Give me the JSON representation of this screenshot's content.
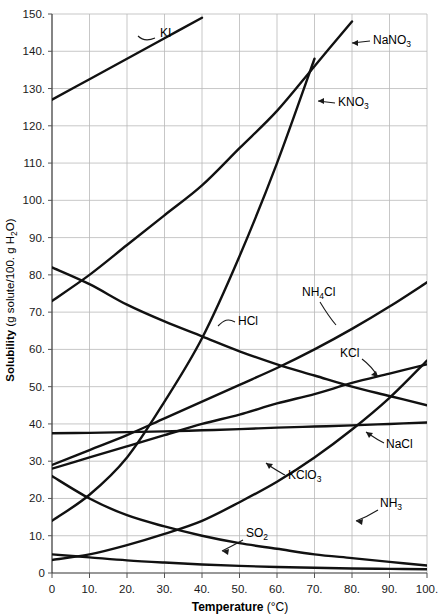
{
  "chart_data": {
    "type": "line",
    "title": "",
    "xlabel": "Temperature (°C)",
    "ylabel": "Solubility (g solute/100. g H2O)",
    "ylabel_parts": {
      "main": "Solubility ",
      "unit_open": "(g solute/100. g H",
      "unit_sub": "2",
      "unit_close": "O)"
    },
    "xlabel_parts": {
      "main": "Temperature ",
      "unit": "(°C)"
    },
    "xlim": [
      0,
      100
    ],
    "ylim": [
      0,
      150
    ],
    "grid": true,
    "legend": "inline-annotations",
    "xticks": [
      "0",
      "10.",
      "20.",
      "30.",
      "40.",
      "50.",
      "60.",
      "70.",
      "80.",
      "90.",
      "100."
    ],
    "xtick_values": [
      0,
      10,
      20,
      30,
      40,
      50,
      60,
      70,
      80,
      90,
      100
    ],
    "yticks": [
      "0",
      "10.",
      "20.",
      "30.",
      "40.",
      "50.",
      "60.",
      "70.",
      "80.",
      "90.",
      "100.",
      "110.",
      "120.",
      "130.",
      "140.",
      "150."
    ],
    "ytick_values": [
      0,
      10,
      20,
      30,
      40,
      50,
      60,
      70,
      80,
      90,
      100,
      110,
      120,
      130,
      140,
      150
    ],
    "x": [
      0,
      10,
      20,
      30,
      40,
      50,
      60,
      70,
      80,
      90,
      100
    ],
    "series": [
      {
        "name": "KI",
        "label_text": "KI",
        "label_base": "KI",
        "label_sub": "",
        "label_x": 160,
        "label_y": 37,
        "leader": "M155,38 C148,41 143,41 138,36",
        "values": [
          127.0,
          132.5,
          138.0,
          143.5,
          149.0,
          null,
          null,
          null,
          null,
          null,
          null
        ]
      },
      {
        "name": "NaNO3",
        "label_text": "NaNO3",
        "label_base": "NaNO",
        "label_sub": "3",
        "label_x": 373,
        "label_y": 44,
        "leader": "M370,41 L352,43",
        "leader_arrow": "M352,43 L358,40 L358,46 Z",
        "values": [
          73.0,
          80.0,
          88.0,
          96.0,
          104.0,
          114.0,
          124.0,
          136.0,
          148.0,
          null,
          null
        ]
      },
      {
        "name": "KNO3",
        "label_text": "KNO3",
        "label_base": "KNO",
        "label_sub": "3",
        "label_x": 338,
        "label_y": 106,
        "leader": "M335,103 L318,101",
        "leader_arrow": "M318,101 L324,98 L324,104 Z",
        "values": [
          14.0,
          21.0,
          31.0,
          46.0,
          63.0,
          85.0,
          110.0,
          138.0,
          null,
          null,
          null
        ]
      },
      {
        "name": "NH4Cl",
        "label_text": "NH4Cl",
        "label_base_a": "NH",
        "label_sub": "4",
        "label_base_b": "Cl",
        "label_x": 302,
        "label_y": 296,
        "leader": "M320,302 C326,312 330,318 336,325",
        "values": [
          29.0,
          33.0,
          37.0,
          41.5,
          46.0,
          50.5,
          55.0,
          60.0,
          65.5,
          71.5,
          78.0
        ]
      },
      {
        "name": "HCl",
        "label_text": "HCl",
        "label_base": "HCl",
        "label_sub": "",
        "label_x": 238,
        "label_y": 325,
        "leader": "M235,322 C228,318 224,320 218,326",
        "values": [
          82.0,
          77.5,
          72.0,
          67.5,
          63.5,
          59.5,
          56.0,
          53.0,
          50.0,
          47.5,
          45.0
        ]
      },
      {
        "name": "KCl",
        "label_text": "KCl",
        "label_base": "KCl",
        "label_sub": "",
        "label_x": 340,
        "label_y": 357,
        "leader": "M362,359 C370,365 374,370 378,377",
        "leader_arrow": "M378,377 L371,375 L376,371 Z",
        "values": [
          28.0,
          31.0,
          34.0,
          37.0,
          40.0,
          42.5,
          45.5,
          48.0,
          51.0,
          53.5,
          56.0
        ]
      },
      {
        "name": "NaCl",
        "label_text": "NaCl",
        "label_base": "NaCl",
        "label_sub": "",
        "label_x": 386,
        "label_y": 448,
        "leader": "M384,443 C376,439 372,436 366,432",
        "leader_arrow": "M366,432 L373,433 L369,438 Z",
        "values": [
          37.5,
          37.6,
          37.8,
          38.0,
          38.3,
          38.6,
          39.0,
          39.3,
          39.6,
          40.0,
          40.4
        ]
      },
      {
        "name": "KClO3",
        "label_text": "KClO3",
        "label_base": "KClO",
        "label_sub": "3",
        "label_x": 288,
        "label_y": 479,
        "leader": "M285,475 C276,470 272,468 266,463",
        "leader_arrow": "M266,463 L273,464 L269,469 Z",
        "values": [
          3.5,
          5.0,
          7.5,
          10.5,
          14.0,
          19.0,
          24.5,
          31.0,
          38.5,
          47.0,
          57.0
        ]
      },
      {
        "name": "NH3",
        "label_text": "NH3",
        "label_base": "NH",
        "label_sub": "3",
        "label_x": 380,
        "label_y": 507,
        "leader": "M378,510 C370,515 364,518 356,521",
        "leader_arrow": "M356,521 L363,519 L362,525 Z",
        "values": [
          26.0,
          20.0,
          15.5,
          12.5,
          10.0,
          8.0,
          6.5,
          5.0,
          4.0,
          3.0,
          2.0
        ]
      },
      {
        "name": "SO2",
        "label_text": "SO2",
        "label_base": "SO",
        "label_sub": "2",
        "label_x": 246,
        "label_y": 537,
        "leader": "M243,540 C234,545 228,548 222,551",
        "leader_arrow": "M222,551 L229,549 L228,555 Z",
        "values": [
          5.0,
          4.2,
          3.4,
          2.8,
          2.3,
          1.9,
          1.6,
          1.4,
          1.2,
          1.1,
          1.0
        ]
      }
    ]
  }
}
